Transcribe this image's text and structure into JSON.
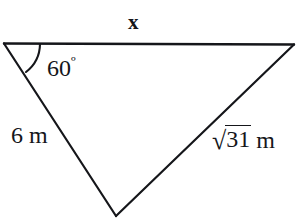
{
  "figure": {
    "type": "triangle-diagram",
    "stroke_color": "#15161a",
    "background_color": "#ffffff",
    "labels": {
      "top_side": "x",
      "angle": "60",
      "angle_degree_symbol": "º",
      "left_side": "6 m",
      "right_side_radicand": "31",
      "right_side_radical_symbol": "√",
      "right_side_unit": "m"
    },
    "geometry": {
      "vertices": {
        "top_left": [
          4,
          43
        ],
        "top_right": [
          294,
          44
        ],
        "bottom": [
          116,
          216
        ]
      },
      "angle_arc": {
        "at_vertex": "top_left",
        "value_degrees": 60
      }
    }
  }
}
